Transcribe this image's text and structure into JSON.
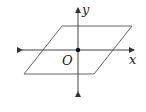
{
  "diagram": {
    "type": "coordinate-plane",
    "labels": {
      "y_axis": "y",
      "x_axis": "x",
      "origin": "O"
    },
    "stroke_color": "#555555",
    "parallelogram": {
      "vertices": [
        [
          62,
          26
        ],
        [
          132,
          26
        ],
        [
          94,
          74
        ],
        [
          24,
          74
        ]
      ]
    },
    "x_axis": {
      "from": [
        17,
        50
      ],
      "to": [
        139,
        50
      ],
      "bidirectional": true
    },
    "y_axis": {
      "from": [
        78,
        97
      ],
      "to": [
        78,
        3
      ],
      "bidirectional": true
    },
    "origin_point": [
      78,
      50
    ]
  }
}
